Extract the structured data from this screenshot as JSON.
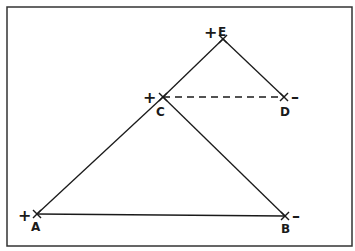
{
  "diagram": {
    "frame": {
      "x": 7,
      "y": 7,
      "w": 345,
      "h": 239,
      "color": "#333333"
    },
    "line_color": "#1a1a1a",
    "points": [
      {
        "id": "A",
        "label": "A",
        "sign": "+",
        "x": 37,
        "y": 214
      },
      {
        "id": "B",
        "label": "B",
        "sign": "–",
        "x": 285,
        "y": 216
      },
      {
        "id": "C",
        "label": "C",
        "sign": "+",
        "x": 163,
        "y": 97
      },
      {
        "id": "D",
        "label": "D",
        "sign": "–",
        "x": 284,
        "y": 97
      },
      {
        "id": "E",
        "label": "E",
        "sign": "+",
        "x": 223,
        "y": 39
      }
    ],
    "segments": [
      {
        "from": "A",
        "to": "B",
        "style": "solid"
      },
      {
        "from": "A",
        "to": "C",
        "style": "solid"
      },
      {
        "from": "C",
        "to": "E",
        "style": "solid"
      },
      {
        "from": "C",
        "to": "B",
        "style": "solid"
      },
      {
        "from": "E",
        "to": "D",
        "style": "solid"
      },
      {
        "from": "C",
        "to": "D",
        "style": "dashed"
      }
    ]
  }
}
